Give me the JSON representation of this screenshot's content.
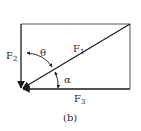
{
  "diagram": {
    "caption": "(b)",
    "forces": [
      {
        "name": "F",
        "sub": "1",
        "description": "diagonal force from top-right corner to origin"
      },
      {
        "name": "F",
        "sub": "2",
        "description": "vertical downward force along left edge"
      },
      {
        "name": "F",
        "sub": "3",
        "description": "horizontal leftward force along bottom edge"
      }
    ],
    "angles": [
      {
        "symbol": "θ",
        "between": "F2 and F1"
      },
      {
        "symbol": "α",
        "between": "F1 and F3"
      }
    ],
    "colors": {
      "line": "#1a1a1a",
      "frame": "#555555",
      "background": "#ffffff"
    }
  }
}
